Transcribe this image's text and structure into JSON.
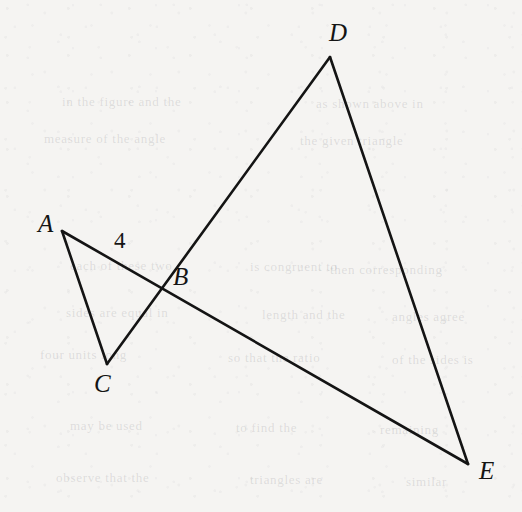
{
  "figure": {
    "canvas": {
      "width": 522,
      "height": 512
    },
    "background_color": "#f5f4f2",
    "stroke_color": "#141414",
    "stroke_width": 2.6,
    "points": {
      "A": {
        "label": "A",
        "x": 62,
        "y": 231,
        "label_x": 38,
        "label_y": 211
      },
      "B": {
        "label": "B",
        "x": 163,
        "y": 290,
        "label_x": 173,
        "label_y": 264
      },
      "C": {
        "label": "C",
        "x": 107,
        "y": 364,
        "label_x": 94,
        "label_y": 371
      },
      "D": {
        "label": "D",
        "x": 330,
        "y": 57,
        "label_x": 329,
        "label_y": 20
      },
      "E": {
        "label": "E",
        "x": 468,
        "y": 464,
        "label_x": 479,
        "label_y": 458
      }
    },
    "segments": [
      {
        "name": "segment-A-E",
        "from": "A",
        "to": "E",
        "note": "A, B and E are collinear"
      },
      {
        "name": "segment-C-D",
        "from": "C",
        "to": "D",
        "note": "C, B and D are collinear"
      },
      {
        "name": "segment-A-C",
        "from": "A",
        "to": "C"
      },
      {
        "name": "segment-D-E",
        "from": "D",
        "to": "E"
      }
    ],
    "measures": [
      {
        "name": "length-AB",
        "text": "4",
        "segment": "AB",
        "x": 114,
        "y": 229
      }
    ],
    "showthrough_lines": [
      {
        "text": "in the figure and the",
        "x": 62,
        "y": 94
      },
      {
        "text": "as shown above in",
        "x": 316,
        "y": 96
      },
      {
        "text": "measure of the angle",
        "x": 44,
        "y": 131
      },
      {
        "text": "the given triangle",
        "x": 300,
        "y": 133
      },
      {
        "text": "each of these two",
        "x": 70,
        "y": 258
      },
      {
        "text": "is congruent to",
        "x": 250,
        "y": 259
      },
      {
        "text": "then corresponding",
        "x": 330,
        "y": 262
      },
      {
        "text": "sides are equal in",
        "x": 66,
        "y": 305
      },
      {
        "text": "length and the",
        "x": 262,
        "y": 307
      },
      {
        "text": "angles agree",
        "x": 392,
        "y": 309
      },
      {
        "text": "four units long",
        "x": 40,
        "y": 347
      },
      {
        "text": "so that the ratio",
        "x": 228,
        "y": 350
      },
      {
        "text": "of the sides is",
        "x": 392,
        "y": 352
      },
      {
        "text": "may be used",
        "x": 70,
        "y": 418
      },
      {
        "text": "to find the",
        "x": 236,
        "y": 420
      },
      {
        "text": "remaining",
        "x": 380,
        "y": 422
      },
      {
        "text": "observe that the",
        "x": 56,
        "y": 470
      },
      {
        "text": "triangles are",
        "x": 250,
        "y": 472
      },
      {
        "text": "similar",
        "x": 406,
        "y": 474
      }
    ]
  }
}
